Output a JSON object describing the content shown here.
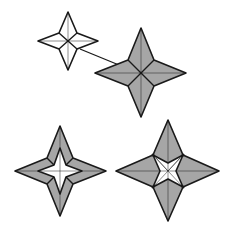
{
  "diagram": {
    "type": "origami-folding-steps",
    "colors": {
      "background": "#ffffff",
      "paper_colored": "#a6a6a6",
      "paper_white": "#ffffff",
      "line": "#1a1a1a"
    },
    "steps": [
      {
        "id": "step-1",
        "description": "white four-pointed star, unfolded side"
      },
      {
        "id": "step-2",
        "description": "gray four-pointed star, turned over"
      },
      {
        "id": "step-3",
        "description": "gray star with small white star in center"
      },
      {
        "id": "step-4",
        "description": "gray star with larger white center pinwheel"
      }
    ],
    "arrow": {
      "from": "step-1",
      "to": "step-2",
      "meaning": "turn over / result"
    }
  }
}
